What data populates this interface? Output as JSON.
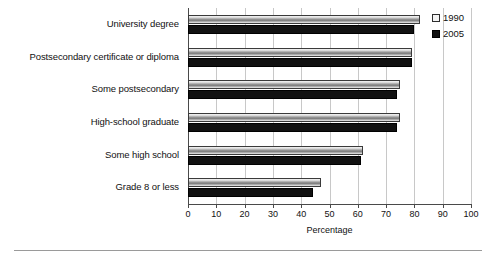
{
  "chart_data": {
    "type": "bar",
    "orientation": "horizontal",
    "title": "",
    "xlabel": "Percentage",
    "ylabel": "",
    "xlim": [
      0,
      100
    ],
    "xticks": [
      0,
      10,
      20,
      30,
      40,
      50,
      60,
      70,
      80,
      90,
      100
    ],
    "grid": true,
    "legend_position": "top-right",
    "categories": [
      "University degree",
      "Postsecondary certificate or diploma",
      "Some postsecondary",
      "High-school graduate",
      "Some high school",
      "Grade 8 or less"
    ],
    "series": [
      {
        "name": "1990",
        "color": "#b0b0b0",
        "values": [
          82,
          79,
          75,
          75,
          62,
          47
        ]
      },
      {
        "name": "2005",
        "color": "#111111",
        "values": [
          80,
          79,
          74,
          74,
          61,
          44
        ]
      }
    ]
  },
  "axis": {
    "xlabel": "Percentage",
    "tick_labels": [
      "0",
      "10",
      "20",
      "30",
      "40",
      "50",
      "60",
      "70",
      "80",
      "90",
      "100"
    ]
  },
  "legend": {
    "items": [
      {
        "label": "1990"
      },
      {
        "label": "2005"
      }
    ]
  }
}
